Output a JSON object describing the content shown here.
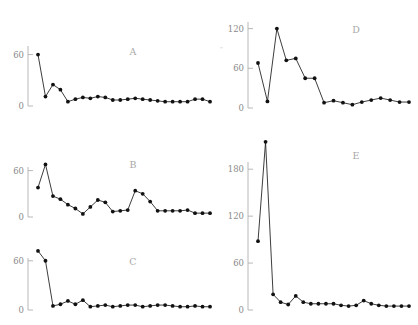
{
  "figure": {
    "background_color": "#ffffff",
    "line_color": "#1a1a1a",
    "marker_color": "#111111",
    "axis_color": "#b0b0b0",
    "tick_label_color": "#8a8a8a",
    "panel_letter_color": "#a8a8a8",
    "width": 418,
    "height": 325,
    "layout": "2 columns x 3 rows (left column A,B,C; right column D,E)"
  },
  "chart_data": [
    {
      "id": "A",
      "type": "line",
      "title": "A",
      "xlabel": "",
      "ylabel": "",
      "grid": false,
      "legend": null,
      "marker": "filled-circle",
      "yticks": [
        0,
        60
      ],
      "ytick_labels": [
        "0",
        "60"
      ],
      "ylim": [
        0,
        70
      ],
      "xlim": [
        0,
        25
      ],
      "x": [
        1,
        2,
        3,
        4,
        5,
        6,
        7,
        8,
        9,
        10,
        11,
        12,
        13,
        14,
        15,
        16,
        17,
        18,
        19,
        20,
        21,
        22,
        23,
        24
      ],
      "values": [
        60,
        11,
        25,
        19,
        5,
        8,
        10,
        9,
        11,
        10,
        7,
        7,
        8,
        9,
        8,
        7,
        6,
        5,
        5,
        5,
        5,
        8,
        8,
        5
      ]
    },
    {
      "id": "B",
      "type": "line",
      "title": "B",
      "xlabel": "",
      "ylabel": "",
      "grid": false,
      "legend": null,
      "marker": "filled-circle",
      "yticks": [
        0,
        60
      ],
      "ytick_labels": [
        "0",
        "60"
      ],
      "ylim": [
        0,
        75
      ],
      "xlim": [
        0,
        25
      ],
      "x": [
        1,
        2,
        3,
        4,
        5,
        6,
        7,
        8,
        9,
        10,
        11,
        12,
        13,
        14,
        15,
        16,
        17,
        18,
        19,
        20,
        21,
        22,
        23,
        24
      ],
      "values": [
        38,
        68,
        27,
        23,
        16,
        11,
        4,
        13,
        22,
        19,
        7,
        8,
        9,
        34,
        30,
        20,
        8,
        8,
        8,
        8,
        9,
        5,
        5,
        5
      ]
    },
    {
      "id": "C",
      "type": "line",
      "title": "C",
      "xlabel": "",
      "ylabel": "",
      "grid": false,
      "legend": null,
      "marker": "filled-circle",
      "yticks": [
        0,
        60
      ],
      "ytick_labels": [
        "0",
        "60"
      ],
      "ylim": [
        0,
        78
      ],
      "xlim": [
        0,
        25
      ],
      "x": [
        1,
        2,
        3,
        4,
        5,
        6,
        7,
        8,
        9,
        10,
        11,
        12,
        13,
        14,
        15,
        16,
        17,
        18,
        19,
        20,
        21,
        22,
        23,
        24
      ],
      "values": [
        72,
        60,
        5,
        7,
        11,
        7,
        12,
        4,
        5,
        6,
        4,
        5,
        6,
        6,
        4,
        5,
        6,
        6,
        5,
        4,
        4,
        5,
        4,
        4
      ]
    },
    {
      "id": "D",
      "type": "line",
      "title": "D",
      "xlabel": "",
      "ylabel": "",
      "grid": false,
      "legend": null,
      "marker": "filled-circle",
      "yticks": [
        0,
        60,
        120
      ],
      "ytick_labels": [
        "0",
        "60",
        "120"
      ],
      "ylim": [
        0,
        130
      ],
      "xlim": [
        0,
        18
      ],
      "x": [
        1,
        2,
        3,
        4,
        5,
        6,
        7,
        8,
        9,
        10,
        11,
        12,
        13,
        14,
        15,
        16,
        17
      ],
      "values": [
        68,
        10,
        120,
        72,
        75,
        45,
        45,
        8,
        11,
        8,
        5,
        9,
        12,
        15,
        12,
        9,
        9
      ]
    },
    {
      "id": "E",
      "type": "line",
      "title": "E",
      "xlabel": "",
      "ylabel": "",
      "grid": false,
      "legend": null,
      "marker": "filled-circle",
      "yticks": [
        0,
        60,
        120,
        180
      ],
      "ytick_labels": [
        "0",
        "60",
        "120",
        "180"
      ],
      "ylim": [
        0,
        225
      ],
      "xlim": [
        0,
        22
      ],
      "x": [
        1,
        2,
        3,
        4,
        5,
        6,
        7,
        8,
        9,
        10,
        11,
        12,
        13,
        14,
        15,
        16,
        17,
        18,
        19,
        20,
        21
      ],
      "values": [
        88,
        215,
        20,
        10,
        7,
        18,
        10,
        8,
        8,
        8,
        8,
        6,
        5,
        6,
        12,
        8,
        6,
        5,
        5,
        5,
        5
      ]
    }
  ]
}
